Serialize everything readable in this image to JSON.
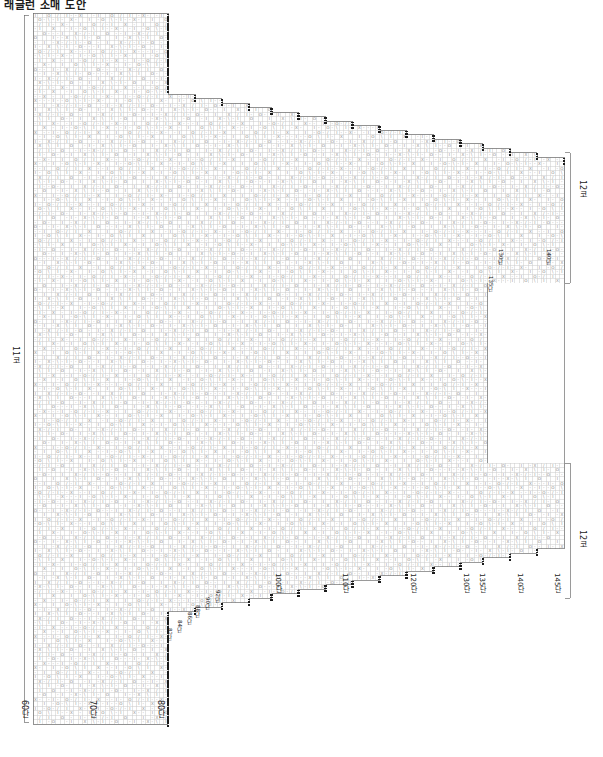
{
  "document": {
    "title": "래글런 소매 도안",
    "type": "knitting-chart"
  },
  "chart_data": {
    "type": "heatmap",
    "title": "래글런 소매 도안",
    "xlabel": "",
    "ylabel": "",
    "grid": true,
    "legend_position": "none",
    "cell_size": 4.5,
    "columns": 118,
    "rows": 158,
    "symbols": [
      {
        "glyph": "O",
        "name": "yarn-over"
      },
      {
        "glyph": "X",
        "name": "cross-stitch"
      },
      {
        "glyph": "I",
        "name": "knit-stitch"
      },
      {
        "glyph": "-",
        "name": "purl-stitch"
      },
      {
        "glyph": "/",
        "name": "decrease-right"
      },
      {
        "glyph": "\\",
        "name": "decrease-left"
      }
    ],
    "row_axis": {
      "unit": "단",
      "ticks": [
        {
          "label": "60단",
          "x": 20,
          "y": 700
        },
        {
          "label": "70단",
          "x": 88,
          "y": 700
        },
        {
          "label": "80단",
          "x": 156,
          "y": 700
        }
      ]
    },
    "interior_row_ticks": [
      {
        "label": "100단",
        "x": 274,
        "y": 573
      },
      {
        "label": "110단",
        "x": 341,
        "y": 573
      },
      {
        "label": "120단",
        "x": 409,
        "y": 573
      },
      {
        "label": "130단",
        "x": 462,
        "y": 573
      },
      {
        "label": "135단",
        "x": 478,
        "y": 573
      },
      {
        "label": "140단",
        "x": 516,
        "y": 573
      },
      {
        "label": "145단",
        "x": 553,
        "y": 573
      }
    ],
    "staircase_row_ticks_lower": [
      {
        "label": "82단",
        "x": 166,
        "y": 628
      },
      {
        "label": "84단",
        "x": 176,
        "y": 620
      },
      {
        "label": "86단",
        "x": 186,
        "y": 612
      },
      {
        "label": "88단",
        "x": 194,
        "y": 605
      },
      {
        "label": "90단",
        "x": 204,
        "y": 597
      },
      {
        "label": "92단",
        "x": 214,
        "y": 590
      }
    ],
    "staircase_row_ticks_upper": [
      {
        "label": "130단",
        "x": 497,
        "y": 249
      },
      {
        "label": "135단",
        "x": 487,
        "y": 276
      },
      {
        "label": "140단",
        "x": 545,
        "y": 249
      }
    ],
    "bracket_labels": [
      {
        "label": "11코",
        "orientation": "vertical",
        "x": 11,
        "y": 346,
        "side": "left"
      },
      {
        "label": "12코",
        "orientation": "vertical",
        "x": 578,
        "y": 180,
        "side": "right-top"
      },
      {
        "label": "12코",
        "orientation": "vertical",
        "x": 578,
        "y": 530,
        "side": "right-bottom"
      }
    ]
  },
  "axis_labels": {
    "left_bracket": "11코",
    "right_top_bracket": "12코",
    "right_bottom_bracket": "12코"
  },
  "row_labels_bottom": [
    "60단",
    "70단",
    "80단"
  ],
  "row_labels_interior": [
    "100단",
    "110단",
    "120단",
    "130단",
    "135단",
    "140단",
    "145단"
  ],
  "row_labels_step_lower": [
    "82단",
    "84단",
    "86단",
    "88단",
    "90단",
    "92단"
  ],
  "row_labels_step_upper": [
    "130단",
    "135단",
    "140단"
  ],
  "colors": {
    "grid_line": "#c9c9c9",
    "outline": "#6f6f6f",
    "symbol": "#8a8a8a",
    "marker": "#1a1a1a",
    "text": "#1b1b1b",
    "background": "#ffffff"
  }
}
